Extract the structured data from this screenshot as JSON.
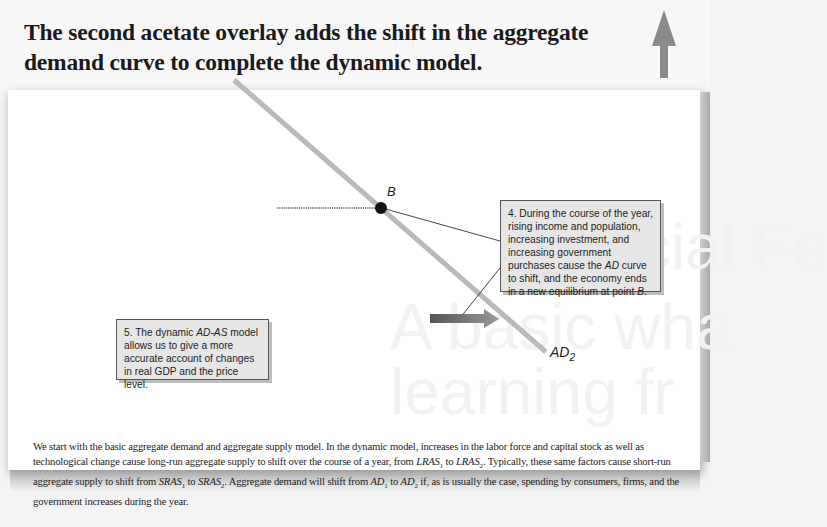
{
  "header": {
    "title": "The second acetate overlay adds the shift in the aggregate demand curve to complete the dynamic model."
  },
  "background_ghost_text": {
    "line1": "Special Fe",
    "line2": "A basic wha",
    "line3": "learning fr"
  },
  "diagram": {
    "point_label": "B",
    "curve_label": "AD",
    "curve_label_sub": "2",
    "colors": {
      "curve": "#b9b9b9",
      "point": "#111111",
      "shift_arrow": "#7a7a7a",
      "up_arrow": "#8a8a8a",
      "callout_bg": "#e6e6e6"
    }
  },
  "callouts": {
    "step4": {
      "prefix": "4.  During the course of the year, rising income and population, increasing investment, and increasing government purchases cause the ",
      "em": "AD",
      "mid": " curve to shift, and the economy ends in a new equilibrium at point ",
      "em2": "B",
      "suffix": "."
    },
    "step5": {
      "prefix": "5.  The dynamic ",
      "em": "AD-AS",
      "suffix": " model allows us to give a more accurate account of changes in real GDP and the price level."
    }
  },
  "caption": {
    "p1": "We start with the basic aggregate demand and aggregate supply model. In the dynamic model, increases in the labor force and capital stock as well as technological change cause long-run aggregate supply to shift over the course of a year, from ",
    "lras": "LRAS",
    "sub1": "1",
    "to": " to ",
    "sub2": "2",
    "p2": ". Typically, these same factors cause short-run aggregate supply to shift from ",
    "sras": "SRAS",
    "p3": ". Aggregate demand will shift from ",
    "ad": "AD",
    "p4": " if, as is usually the case, spending by consumers, firms, and the government increases during the year."
  }
}
